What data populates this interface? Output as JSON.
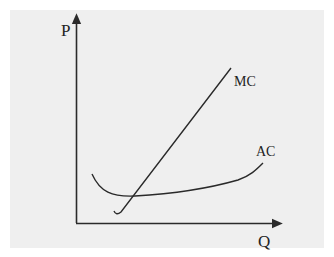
{
  "diagram": {
    "type": "cost-curves",
    "axes": {
      "y_label": "P",
      "x_label": "Q"
    },
    "curves": [
      {
        "name": "MC",
        "label": "MC",
        "shape": "upward-sloping line with slight hook at bottom"
      },
      {
        "name": "AC",
        "label": "AC",
        "shape": "U-shaped, flat-bottomed, rising to the right"
      }
    ],
    "colors": {
      "background": "#ffffff",
      "panel": "#efefef",
      "line": "#2a2a2a",
      "text": "#222222"
    }
  }
}
